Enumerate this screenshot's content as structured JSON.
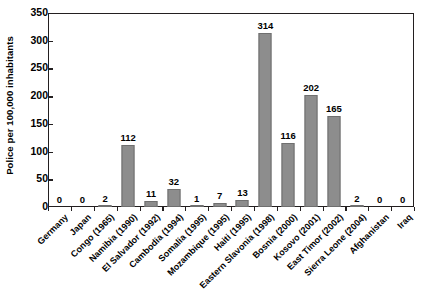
{
  "chart_data": {
    "type": "bar",
    "title": "",
    "xlabel": "",
    "ylabel": "Police per 100,000 inhabitants",
    "ylim": [
      0,
      350
    ],
    "ytick_step": 50,
    "yticks": [
      0,
      50,
      100,
      150,
      200,
      250,
      300,
      350
    ],
    "ytick_labels": [
      "0",
      "50",
      "100",
      "150",
      "200",
      "250",
      "300",
      "350"
    ],
    "grid": false,
    "legend": false,
    "bar_color": "#8d8d8d",
    "bar_edge_color": "#6f6f6f",
    "axis_color": "#231f20",
    "categories": [
      "Germany",
      "Japan",
      "Congo (1965)",
      "Namibia (1990)",
      "El Salvador (1992)",
      "Cambodia (1994)",
      "Somalia (1995)",
      "Mozambique (1995)",
      "Haiti (1995)",
      "Eastern Slavonia (1998)",
      "Bosnia (2000)",
      "Kosovo (2001)",
      "East Timor (2002)",
      "Sierra Leone (2004)",
      "Afghanistan",
      "Iraq"
    ],
    "values": [
      0,
      0,
      2,
      112,
      11,
      32,
      1,
      7,
      13,
      314,
      116,
      202,
      165,
      2,
      0,
      0
    ],
    "value_labels": [
      "0",
      "0",
      "2",
      "112",
      "11",
      "32",
      "1",
      "7",
      "13",
      "314",
      "116",
      "202",
      "165",
      "2",
      "0",
      "0"
    ]
  }
}
